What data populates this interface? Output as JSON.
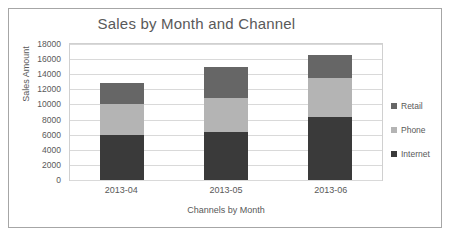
{
  "chart_data": {
    "type": "bar",
    "subtype": "stacked-column",
    "title": "Sales by Month and Channel",
    "xlabel": "Channels by Month",
    "ylabel": "Sales Amount",
    "categories": [
      "2013-04",
      "2013-05",
      "2013-06"
    ],
    "ylim": [
      0,
      18000
    ],
    "ytick_step": 2000,
    "yticks": [
      "18000",
      "16000",
      "14000",
      "12000",
      "10000",
      "8000",
      "6000",
      "4000",
      "2000",
      "0"
    ],
    "grid": true,
    "legend_position": "right",
    "series": [
      {
        "name": "Internet",
        "color": "#3a3a3a",
        "values": [
          5900,
          6400,
          8400
        ]
      },
      {
        "name": "Phone",
        "color": "#b4b4b4",
        "values": [
          4100,
          4400,
          5100
        ]
      },
      {
        "name": "Retail",
        "color": "#666666",
        "values": [
          2900,
          4200,
          3100
        ]
      }
    ],
    "stack_totals": [
      12900,
      15000,
      16600
    ],
    "legend_entries": [
      {
        "label": "Retail",
        "color": "#666666"
      },
      {
        "label": "Phone",
        "color": "#b4b4b4"
      },
      {
        "label": "Internet",
        "color": "#3a3a3a"
      }
    ]
  }
}
